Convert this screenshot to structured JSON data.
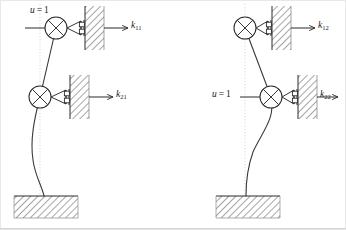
{
  "figure": {
    "type": "structural-stiffness-influence-coefficient-diagram",
    "background_color": "#ffffff",
    "line_color": "#2b2b2b",
    "hatch_color": "#555555",
    "guide_color": "#c8c8c8",
    "width": 346,
    "height": 230
  },
  "panels": [
    {
      "id": "left",
      "name": "panel-k1",
      "description": "Unit displacement applied at upper degree of freedom",
      "unit_displacement": {
        "label_u": "u",
        "label_eq": " = ",
        "label_value": "1",
        "applied_at": "upper-mass",
        "x": 30,
        "y": 8
      },
      "guide_line_x": 40,
      "masses": [
        {
          "name": "upper-mass",
          "cx": 56,
          "cy": 28,
          "r": 11,
          "has_force_arrow": true
        },
        {
          "name": "lower-mass",
          "cx": 40,
          "cy": 97,
          "r": 11,
          "has_force_arrow": false
        }
      ],
      "reactions": [
        {
          "name": "reaction-k11",
          "label_k": "k",
          "label_sub": "11",
          "arrow_y": 28,
          "arrow_x1": 104,
          "arrow_x2": 128,
          "text_x": 131,
          "text_y": 22
        },
        {
          "name": "reaction-k21",
          "label_k": "k",
          "label_sub": "21",
          "arrow_y": 97,
          "arrow_x1": 89,
          "arrow_x2": 113,
          "text_x": 116,
          "text_y": 91
        }
      ],
      "walls": [
        {
          "name": "wall-upper",
          "x": 85,
          "y": 6,
          "w": 19,
          "h": 44
        },
        {
          "name": "wall-lower",
          "x": 70,
          "y": 75,
          "w": 19,
          "h": 44
        }
      ],
      "foundation": {
        "name": "foundation-block",
        "x": 14,
        "y": 196,
        "w": 64,
        "h": 22
      },
      "column_base_x": 44
    },
    {
      "id": "right",
      "name": "panel-k2",
      "description": "Unit displacement applied at lower degree of freedom",
      "unit_displacement": {
        "label_u": "u",
        "label_eq": " = ",
        "label_value": "1",
        "applied_at": "lower-mass",
        "x": 214,
        "y": 91
      },
      "guide_line_x": 245,
      "masses": [
        {
          "name": "upper-mass",
          "cx": 245,
          "cy": 28,
          "r": 11,
          "has_force_arrow": false
        },
        {
          "name": "lower-mass",
          "cx": 271,
          "cy": 97,
          "r": 11,
          "has_force_arrow": true
        }
      ],
      "reactions": [
        {
          "name": "reaction-k12",
          "label_k": "k",
          "label_sub": "12",
          "arrow_y": 28,
          "arrow_x1": 290,
          "arrow_x2": 314,
          "text_x": 302,
          "text_y": 22
        },
        {
          "name": "reaction-k22",
          "label_k": "k",
          "label_sub": "22",
          "arrow_y": 97,
          "arrow_x1": 308,
          "arrow_x2": 332,
          "text_x": 320,
          "text_y": 91
        }
      ],
      "walls": [
        {
          "name": "wall-upper",
          "x": 272,
          "y": 6,
          "w": 19,
          "h": 44
        },
        {
          "name": "wall-lower",
          "x": 298,
          "y": 75,
          "w": 19,
          "h": 44
        }
      ],
      "foundation": {
        "name": "foundation-block",
        "x": 216,
        "y": 196,
        "w": 64,
        "h": 22
      },
      "column_base_x": 246
    }
  ],
  "labels": {
    "k11": {
      "base": "k",
      "sub": "11"
    },
    "k21": {
      "base": "k",
      "sub": "21"
    },
    "k12": {
      "base": "k",
      "sub": "12"
    },
    "k22": {
      "base": "k",
      "sub": "22"
    },
    "u_left": {
      "base": "u",
      "eq": "=",
      "value": "1"
    },
    "u_right": {
      "base": "u",
      "eq": "=",
      "value": "1"
    }
  }
}
